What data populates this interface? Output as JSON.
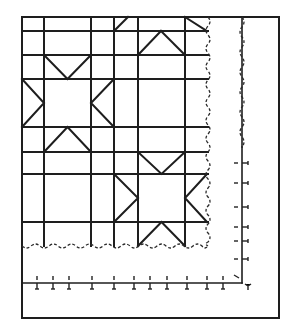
{
  "diagram": {
    "colors": {
      "ink": "#1e1e1e",
      "background": "#ffffff"
    },
    "frame": {
      "x1": 22,
      "y1": 17,
      "x2": 279,
      "y2": 318
    },
    "grid": {
      "columns": [
        22,
        44,
        91,
        114,
        138,
        185
      ],
      "rows": [
        17,
        31,
        55,
        79,
        127,
        152,
        174,
        222
      ],
      "right_edge": 208,
      "bottom_edge": 246
    },
    "stars": [
      {
        "name": "left-star",
        "center": {
          "x1": 44,
          "y1": 79,
          "x2": 91,
          "y2": 127
        },
        "left_x": 22,
        "right_x": 114,
        "top_y": 55,
        "bottom_y": 152
      },
      {
        "name": "right-star",
        "center": {
          "x1": 138,
          "y1": 174,
          "x2": 185,
          "y2": 222
        },
        "left_x": 114,
        "right_x": 207,
        "top_y": 152,
        "bottom_y": 246
      }
    ],
    "partial_star_lines": [
      [
        114,
        31,
        128,
        17
      ],
      [
        138,
        55,
        161,
        31
      ],
      [
        161,
        31,
        185,
        55
      ],
      [
        185,
        17,
        207,
        31
      ]
    ],
    "binding_wave": {
      "x": 208,
      "y_top": 17,
      "y_bottom": 246,
      "x_left": 22
    },
    "outer_wave": {
      "x": 242,
      "y_top": 17,
      "y_end": 147
    },
    "ruler": {
      "vertical_x": 242,
      "corner_y": 283,
      "start_y": 147,
      "left_x": 22,
      "horizontal_ticks_x": [
        37,
        53,
        69,
        92,
        114,
        134,
        150,
        167,
        187,
        207,
        223
      ],
      "vertical_ticks_y": [
        163,
        183,
        207,
        227,
        241,
        259
      ]
    }
  }
}
